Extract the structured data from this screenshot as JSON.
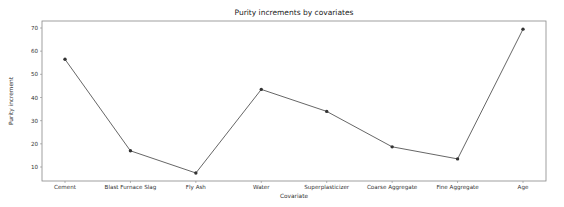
{
  "chart_data": {
    "type": "line",
    "title": "Purity increments by covariates",
    "xlabel": "Covariate",
    "ylabel": "Purity increment",
    "categories": [
      "Cement",
      "Blast Furnace Slag",
      "Fly Ash",
      "Water",
      "Superplasticizer",
      "Coarse Aggregate",
      "Fine Aggregate",
      "Age"
    ],
    "values": [
      56.5,
      17.0,
      7.4,
      43.5,
      34.0,
      18.7,
      13.5,
      69.5
    ],
    "ylim": [
      4,
      72
    ],
    "yticks": [
      10,
      20,
      30,
      40,
      50,
      60,
      70
    ],
    "grid": false,
    "legend": null,
    "line_color": "#555555",
    "marker_color": "#333333"
  }
}
